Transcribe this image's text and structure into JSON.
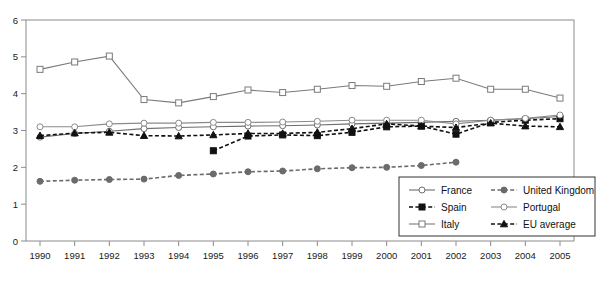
{
  "chart_data": {
    "type": "line",
    "title": "",
    "xlabel": "",
    "ylabel": "",
    "x": [
      1990,
      1991,
      1992,
      1993,
      1994,
      1995,
      1996,
      1997,
      1998,
      1999,
      2000,
      2001,
      2002,
      2003,
      2004,
      2005
    ],
    "categories": [
      "1990",
      "1991",
      "1992",
      "1993",
      "1994",
      "1995",
      "1996",
      "1997",
      "1998",
      "1999",
      "2000",
      "2001",
      "2002",
      "2003",
      "2004",
      "2005"
    ],
    "xlim": [
      1990,
      2005
    ],
    "ylim": [
      0,
      6
    ],
    "yticks": [
      0,
      1,
      2,
      3,
      4,
      5,
      6
    ],
    "ytick_labels": [
      "0",
      "1",
      "2",
      "3",
      "4",
      "5",
      "6"
    ],
    "grid": false,
    "legend_position": "bottom-right",
    "series": [
      {
        "name": "France",
        "marker": "open-circle",
        "line": "solid",
        "color": "#6e6e6e",
        "values": [
          2.82,
          2.92,
          2.98,
          3.05,
          3.08,
          3.1,
          3.12,
          3.13,
          3.15,
          3.18,
          3.2,
          3.22,
          3.25,
          3.28,
          3.32,
          3.38
        ]
      },
      {
        "name": "Spain",
        "marker": "filled-square",
        "line": "dashed",
        "color": "#111111",
        "values": [
          null,
          null,
          null,
          null,
          null,
          2.45,
          2.85,
          2.88,
          2.86,
          2.95,
          3.1,
          3.12,
          2.9,
          3.22,
          3.28,
          3.32
        ]
      },
      {
        "name": "Italy",
        "marker": "open-square",
        "line": "solid",
        "color": "#7a7a7a",
        "values": [
          4.66,
          4.86,
          5.02,
          3.84,
          3.75,
          3.92,
          4.1,
          4.03,
          4.12,
          4.22,
          4.2,
          4.33,
          4.42,
          4.12,
          4.12,
          3.88
        ]
      },
      {
        "name": "United Kingdom",
        "marker": "filled-circle",
        "line": "dashed",
        "color": "#6b6b6b",
        "values": [
          1.62,
          1.65,
          1.67,
          1.68,
          1.78,
          1.82,
          1.88,
          1.9,
          1.96,
          1.99,
          2.0,
          2.05,
          2.14,
          null,
          null,
          null
        ]
      },
      {
        "name": "Portugal",
        "marker": "open-circle",
        "line": "solid",
        "color": "#8a8a8a",
        "values": [
          3.1,
          3.1,
          3.18,
          3.2,
          3.2,
          3.22,
          3.22,
          3.23,
          3.25,
          3.28,
          3.28,
          3.28,
          3.18,
          3.28,
          3.33,
          3.42
        ]
      },
      {
        "name": "EU average",
        "marker": "filled-triangle",
        "line": "dashed",
        "color": "#111111",
        "values": [
          2.86,
          2.93,
          2.95,
          2.86,
          2.85,
          2.88,
          2.92,
          2.92,
          2.95,
          3.05,
          3.18,
          3.12,
          3.08,
          3.2,
          3.12,
          3.1
        ]
      }
    ]
  },
  "legend": {
    "entries": [
      {
        "label": "France"
      },
      {
        "label": "United Kingdom"
      },
      {
        "label": "Spain"
      },
      {
        "label": "Portugal"
      },
      {
        "label": "Italy"
      },
      {
        "label": "EU average"
      }
    ]
  }
}
